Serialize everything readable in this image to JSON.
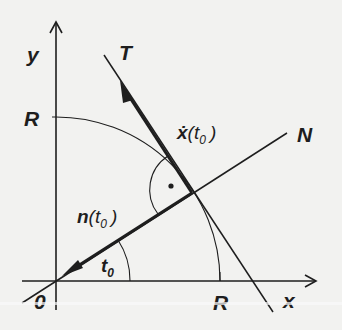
{
  "diagram": {
    "type": "geometry",
    "colors": {
      "background": "#f2f2f0",
      "ink": "#1e1e1e"
    },
    "axes": {
      "x_label": "x",
      "y_label": "y",
      "origin_label": "0"
    },
    "radius_labels": {
      "x_axis": "R",
      "y_axis": "R"
    },
    "lines": {
      "tangent_label": "T",
      "normal_label": "N"
    },
    "vectors": {
      "velocity": {
        "symbol": "ẋ",
        "open": "(",
        "var": "t",
        "sub": "0",
        "close": ")"
      },
      "normal": {
        "symbol": "n",
        "open": "(",
        "var": "t",
        "sub": "0",
        "close": ")"
      }
    },
    "angle": {
      "var": "t",
      "sub": "0"
    },
    "right_angle_marker": "·"
  }
}
